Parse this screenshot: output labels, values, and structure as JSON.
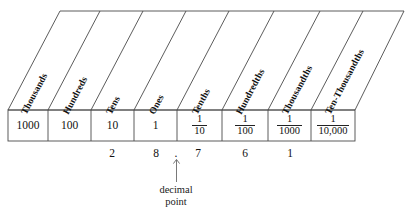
{
  "diagram": {
    "columns": [
      {
        "header": "Thousands",
        "value": "1000",
        "type": "whole",
        "digit": ""
      },
      {
        "header": "Hundreds",
        "value": "100",
        "type": "whole",
        "digit": ""
      },
      {
        "header": "Tens",
        "value": "10",
        "type": "whole",
        "digit": "2"
      },
      {
        "header": "Ones",
        "value": "1",
        "type": "whole",
        "digit": "8"
      },
      {
        "header": "Tenths",
        "numerator": "1",
        "denominator": "10",
        "type": "fraction",
        "digit": "7"
      },
      {
        "header": "Hundredths",
        "numerator": "1",
        "denominator": "100",
        "type": "fraction",
        "digit": "6"
      },
      {
        "header": "Thousandths",
        "numerator": "1",
        "denominator": "1000",
        "type": "fraction",
        "digit": "1"
      },
      {
        "header": "Ten-Thousandths",
        "numerator": "1",
        "denominator": "10,000",
        "type": "fraction",
        "digit": ""
      }
    ],
    "decimal_point": {
      "symbol": ".",
      "caption_line1": "decimal",
      "caption_line2": "point"
    },
    "colors": {
      "line": "#444444",
      "text": "#111111",
      "caption": "#222222",
      "background": "#ffffff"
    }
  }
}
